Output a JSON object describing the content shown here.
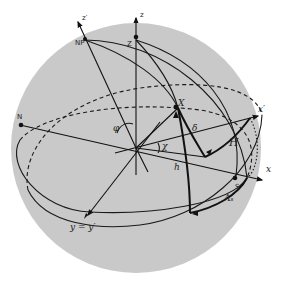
{
  "figure": {
    "colors": {
      "sphere": "#c9c9c9",
      "ink": "#1a1a1a",
      "background": "#ffffff"
    },
    "labels": {
      "z_axis": "z",
      "z_prime_axis": "z′",
      "zenith": "Z",
      "north_pole": "NP",
      "north_point": "N",
      "south_point": "S",
      "star": "X",
      "x_axis": "x",
      "x_prime_axis": "x′",
      "y_axis": "y = y′",
      "latitude": "φ",
      "chi": "χ",
      "declination": "δ",
      "hour_angle": "H",
      "altitude": "h",
      "azimuth": "Aₛ"
    }
  }
}
